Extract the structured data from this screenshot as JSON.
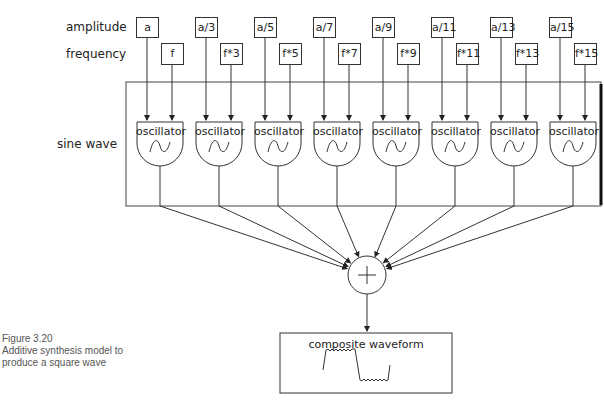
{
  "row_labels": {
    "amplitude": "amplitude",
    "frequency": "frequency",
    "sine_wave": "sine wave"
  },
  "amplitudes": [
    "a",
    "a/3",
    "a/5",
    "a/7",
    "a/9",
    "a/11",
    "a/13",
    "a/15"
  ],
  "frequencies": [
    "f",
    "f*3",
    "f*5",
    "f*7",
    "f*9",
    "f*11",
    "f*13",
    "f*15"
  ],
  "oscillators": [
    "oscillator",
    "oscillator",
    "oscillator",
    "oscillator",
    "oscillator",
    "oscillator",
    "oscillator",
    "oscillator"
  ],
  "summer": {
    "symbol": "+"
  },
  "output": {
    "title": "composite waveform"
  },
  "caption": {
    "figure": "Figure 3.20",
    "line1": "Additive synthesis model to",
    "line2": "produce a square wave"
  }
}
